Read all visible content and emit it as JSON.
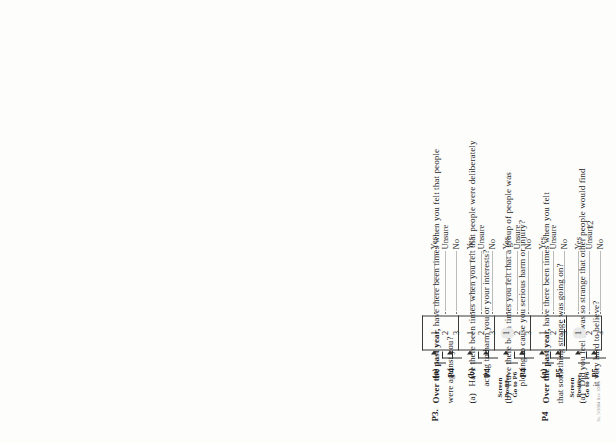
{
  "document": {
    "kind": "scanned-questionnaire-page",
    "orientation": "rotated-90-ccw",
    "page_number": "12",
    "footer_code": "Sc. 5/2004 Rev 10/05"
  },
  "options": {
    "yes": "Yes",
    "unsure": "Unsure",
    "no": "No",
    "code_yes": "1",
    "code_unsure": "2",
    "code_no": "3"
  },
  "questions": [
    {
      "id": "P3",
      "number": "P3.",
      "lead": "Over the past year,",
      "text_rest": " have there been times when you felt that people",
      "text_line2": "were against you?",
      "sub_tag": "",
      "skip_yes": "(a)",
      "skip_no": "P4",
      "screen_positive": null
    },
    {
      "id": "P3a",
      "number": "",
      "lead": "",
      "text_rest": "Have there been times when you felt that people were deliberately",
      "text_line2": "acting to harm you or your interests?",
      "sub_tag": "(a)",
      "skip_yes": "(b)",
      "skip_no": "P4",
      "screen_positive": null
    },
    {
      "id": "P3b",
      "number": "",
      "lead": "",
      "text_rest": "Have there been times you felt that a group of people was",
      "text_line2": "plotting to cause you serious harm or injury?",
      "sub_tag": "(b)",
      "skip_yes": "",
      "skip_no": "P4",
      "screen_positive": {
        "line1": "Screen",
        "line2": "Positive,",
        "line3": "Go to P6"
      }
    },
    {
      "id": "P4",
      "number": "P4",
      "lead": "Over the past year,",
      "text_rest": " have there been times when you felt",
      "text_line2": "that something strange was going on?",
      "sub_tag": "",
      "skip_yes": "(a)",
      "skip_no": "P5",
      "screen_positive": null
    },
    {
      "id": "P4a",
      "number": "",
      "lead": "",
      "text_rest": "Did you feel it was so strange that other people would find",
      "text_line2": "it very hard to believe?",
      "sub_tag": "(a)",
      "skip_yes": "",
      "skip_no": "P5",
      "screen_positive": {
        "line1": "Screen",
        "line2": "Positive,",
        "line3": "Go to P6"
      }
    }
  ]
}
